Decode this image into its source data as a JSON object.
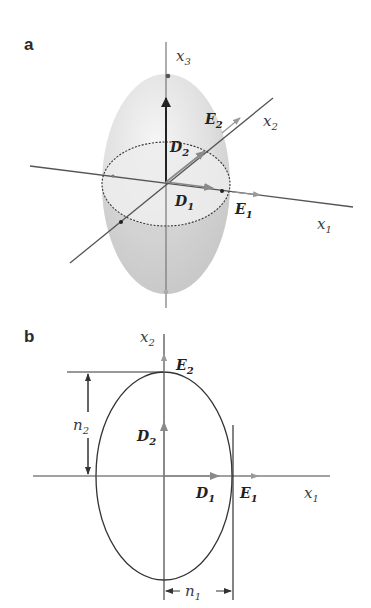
{
  "panel_a": {
    "label": "a",
    "axes": {
      "x1": {
        "name": "x",
        "sub": "1"
      },
      "x2": {
        "name": "x",
        "sub": "2"
      },
      "x3": {
        "name": "x",
        "sub": "3"
      }
    },
    "vectors": {
      "D1": {
        "name": "D",
        "sub": "1"
      },
      "D2": {
        "name": "D",
        "sub": "2"
      },
      "E1": {
        "name": "E",
        "sub": "1"
      },
      "E2": {
        "name": "E",
        "sub": "2"
      }
    }
  },
  "panel_b": {
    "label": "b",
    "axes": {
      "x1": {
        "name": "x",
        "sub": "1"
      },
      "x2": {
        "name": "x",
        "sub": "2"
      }
    },
    "vectors": {
      "D1": {
        "name": "D",
        "sub": "1"
      },
      "D2": {
        "name": "D",
        "sub": "2"
      },
      "E1": {
        "name": "E",
        "sub": "1"
      },
      "E2": {
        "name": "E",
        "sub": "2"
      }
    },
    "dimensions": {
      "n1": {
        "name": "n",
        "sub": "1"
      },
      "n2": {
        "name": "n",
        "sub": "2"
      }
    }
  },
  "colors": {
    "ellipsoid_light": "#eeeeee",
    "ellipsoid_dark": "#c8c8c8",
    "axis_line": "#555555",
    "vector_gray": "#888888",
    "vector_dark": "#222222",
    "outline": "#333333"
  }
}
